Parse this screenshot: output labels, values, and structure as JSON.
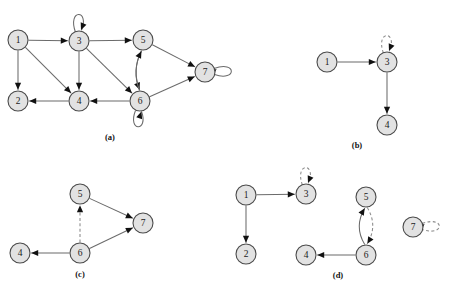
{
  "figure": {
    "background_color": "#ffffff",
    "node_fill_color": "#e2e2e2",
    "node_stroke_color": "#4a4a4a",
    "solid_edge_color": "#6b6b6b",
    "dashed_edge_color": "#8a8a8a",
    "arrow_color": "#111111",
    "node_radius": 10
  },
  "panels": [
    {
      "id": "a",
      "caption": "(a)",
      "caption_pos": {
        "x": 110,
        "y": 140
      },
      "nodes": [
        {
          "id": "1",
          "label": "1",
          "x": 18,
          "y": 40
        },
        {
          "id": "2",
          "label": "2",
          "x": 18,
          "y": 101
        },
        {
          "id": "3",
          "label": "3",
          "x": 79,
          "y": 41
        },
        {
          "id": "4",
          "label": "4",
          "x": 79,
          "y": 101
        },
        {
          "id": "5",
          "label": "5",
          "x": 143,
          "y": 40
        },
        {
          "id": "6",
          "label": "6",
          "x": 140,
          "y": 101
        },
        {
          "id": "7",
          "label": "7",
          "x": 205,
          "y": 72
        }
      ],
      "edges": [
        {
          "from": "1",
          "to": "3",
          "style": "solid",
          "kind": "line"
        },
        {
          "from": "1",
          "to": "2",
          "style": "solid",
          "kind": "line"
        },
        {
          "from": "1",
          "to": "4",
          "style": "solid",
          "kind": "line"
        },
        {
          "from": "3",
          "to": "5",
          "style": "solid",
          "kind": "line"
        },
        {
          "from": "3",
          "to": "4",
          "style": "solid",
          "kind": "line"
        },
        {
          "from": "3",
          "to": "6",
          "style": "solid",
          "kind": "line"
        },
        {
          "from": "3",
          "to": "3",
          "style": "solid",
          "kind": "selfloop",
          "loop_dir": "up"
        },
        {
          "from": "5",
          "to": "6",
          "style": "solid",
          "kind": "curve",
          "bow": 4
        },
        {
          "from": "6",
          "to": "5",
          "style": "solid",
          "kind": "curve",
          "bow": -4
        },
        {
          "from": "5",
          "to": "7",
          "style": "solid",
          "kind": "line"
        },
        {
          "from": "6",
          "to": "7",
          "style": "solid",
          "kind": "line"
        },
        {
          "from": "6",
          "to": "4",
          "style": "solid",
          "kind": "line"
        },
        {
          "from": "4",
          "to": "2",
          "style": "solid",
          "kind": "line"
        },
        {
          "from": "6",
          "to": "6",
          "style": "solid",
          "kind": "selfloop",
          "loop_dir": "down"
        },
        {
          "from": "7",
          "to": "7",
          "style": "solid",
          "kind": "selfloop",
          "loop_dir": "right"
        }
      ]
    },
    {
      "id": "b",
      "caption": "(b)",
      "caption_pos": {
        "x": 357,
        "y": 148
      },
      "nodes": [
        {
          "id": "1",
          "label": "1",
          "x": 327,
          "y": 62
        },
        {
          "id": "3",
          "label": "3",
          "x": 387,
          "y": 62
        },
        {
          "id": "4",
          "label": "4",
          "x": 387,
          "y": 125
        }
      ],
      "edges": [
        {
          "from": "1",
          "to": "3",
          "style": "solid",
          "kind": "line"
        },
        {
          "from": "3",
          "to": "4",
          "style": "solid",
          "kind": "line"
        },
        {
          "from": "3",
          "to": "3",
          "style": "dashed",
          "kind": "selfloop",
          "loop_dir": "up"
        }
      ]
    },
    {
      "id": "c",
      "caption": "(c)",
      "caption_pos": {
        "x": 80,
        "y": 277
      },
      "nodes": [
        {
          "id": "5",
          "label": "5",
          "x": 80,
          "y": 194
        },
        {
          "id": "7",
          "label": "7",
          "x": 143,
          "y": 223
        },
        {
          "id": "4",
          "label": "4",
          "x": 20,
          "y": 253
        },
        {
          "id": "6",
          "label": "6",
          "x": 80,
          "y": 253
        }
      ],
      "edges": [
        {
          "from": "5",
          "to": "7",
          "style": "solid",
          "kind": "line"
        },
        {
          "from": "6",
          "to": "7",
          "style": "solid",
          "kind": "line"
        },
        {
          "from": "6",
          "to": "4",
          "style": "solid",
          "kind": "line"
        },
        {
          "from": "6",
          "to": "5",
          "style": "dashed",
          "kind": "line"
        }
      ]
    },
    {
      "id": "d",
      "caption": "(d)",
      "caption_pos": {
        "x": 338,
        "y": 278
      },
      "nodes": [
        {
          "id": "1",
          "label": "1",
          "x": 246,
          "y": 195
        },
        {
          "id": "3",
          "label": "3",
          "x": 306,
          "y": 194
        },
        {
          "id": "2",
          "label": "2",
          "x": 246,
          "y": 254
        },
        {
          "id": "4",
          "label": "4",
          "x": 306,
          "y": 255
        },
        {
          "id": "5",
          "label": "5",
          "x": 366,
          "y": 197
        },
        {
          "id": "6",
          "label": "6",
          "x": 366,
          "y": 255
        },
        {
          "id": "7",
          "label": "7",
          "x": 413,
          "y": 227
        }
      ],
      "edges": [
        {
          "from": "1",
          "to": "3",
          "style": "solid",
          "kind": "line"
        },
        {
          "from": "1",
          "to": "2",
          "style": "solid",
          "kind": "line"
        },
        {
          "from": "3",
          "to": "3",
          "style": "dashed",
          "kind": "selfloop",
          "loop_dir": "up"
        },
        {
          "from": "6",
          "to": "5",
          "style": "solid",
          "kind": "curve",
          "bow": -5
        },
        {
          "from": "5",
          "to": "6",
          "style": "dashed",
          "kind": "curve",
          "bow": -5
        },
        {
          "from": "6",
          "to": "4",
          "style": "solid",
          "kind": "line"
        },
        {
          "from": "7",
          "to": "7",
          "style": "dashed",
          "kind": "selfloop",
          "loop_dir": "right"
        }
      ]
    }
  ]
}
